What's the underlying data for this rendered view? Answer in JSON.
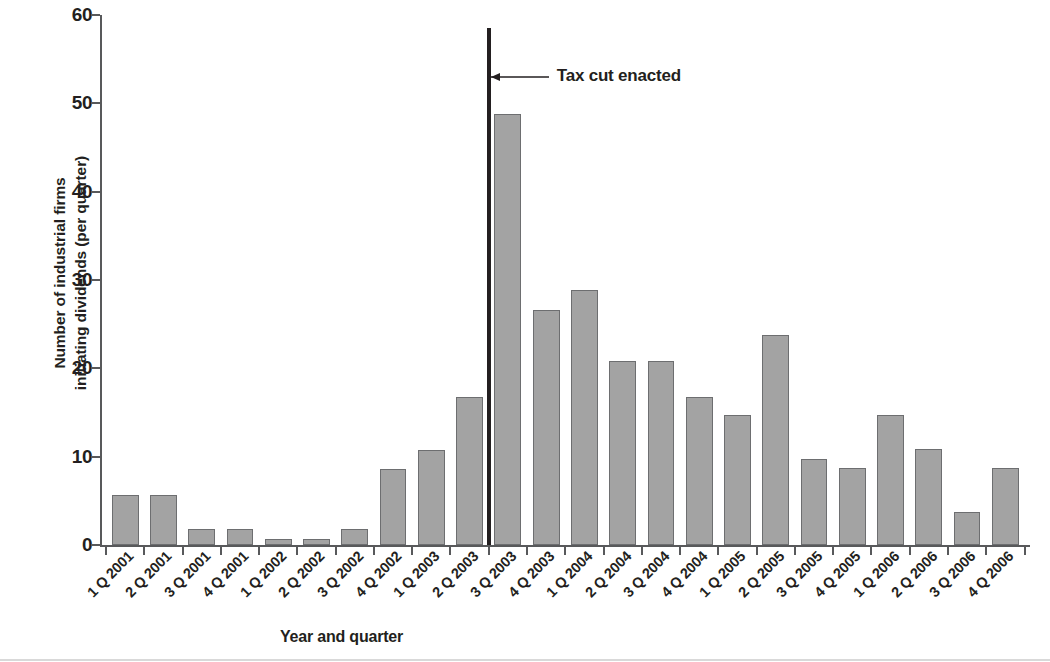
{
  "chart_data": {
    "type": "bar",
    "title": "",
    "xlabel": "Year and quarter",
    "ylabel": "Number of industrial firms initiating dividends (per quarter)",
    "ylabel_lines": [
      "Number of industrial firms",
      "initiating dividends (per quarter)"
    ],
    "ylim": [
      0,
      60
    ],
    "yticks": [
      0,
      10,
      20,
      30,
      40,
      50,
      60
    ],
    "ytick_labels": [
      "0",
      "10",
      "20",
      "30",
      "40",
      "50",
      "60"
    ],
    "grid": false,
    "legend": "none",
    "bar_color": "#a3a3a3",
    "bar_edge_color": "#6d6e70",
    "axis_color": "#58595b",
    "text_color": "#231f20",
    "categories": [
      "1 Q 2001",
      "2 Q 2001",
      "3 Q 2001",
      "4 Q 2001",
      "1 Q 2002",
      "2 Q 2002",
      "3 Q 2002",
      "4 Q 2002",
      "1 Q 2003",
      "2 Q 2003",
      "3 Q 2003",
      "4 Q 2003",
      "1 Q 2004",
      "2 Q 2004",
      "3 Q 2004",
      "4 Q 2004",
      "1 Q 2005",
      "2 Q 2005",
      "3 Q 2005",
      "4 Q 2005",
      "1 Q 2006",
      "2 Q 2006",
      "3 Q 2006",
      "4 Q 2006"
    ],
    "values": [
      5.7,
      5.7,
      1.8,
      1.8,
      0.7,
      0.7,
      1.8,
      8.6,
      10.8,
      16.8,
      48.8,
      26.6,
      28.9,
      20.8,
      20.8,
      16.8,
      14.7,
      23.8,
      9.7,
      8.7,
      14.7,
      10.9,
      3.7,
      8.7
    ],
    "annotations": [
      {
        "label": "Tax cut enacted",
        "type": "vertical-line-with-arrow",
        "after_category": "2 Q 2003",
        "line_top_value": 58.5,
        "arrow_value": 53
      }
    ]
  }
}
